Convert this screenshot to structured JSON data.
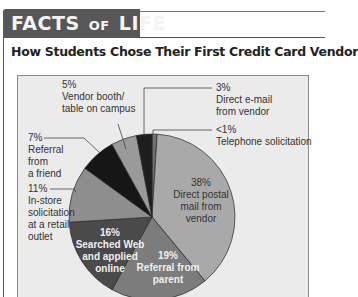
{
  "header": {
    "band_word1": "FACTS",
    "band_word2": "OF",
    "band_word3": "LIFE"
  },
  "title": "How Students Chose Their First Credit Card Vendor",
  "labels": {
    "vendor_booth": {
      "pct": "5%",
      "line1": "Vendor booth/",
      "line2": "table on campus"
    },
    "direct_email": {
      "pct": "3%",
      "line1": "Direct e-mail",
      "line2": "from vendor"
    },
    "telephone": {
      "pct": "<1%",
      "line1": "Telephone solicitation"
    },
    "referral_friend": {
      "pct": "7%",
      "line1": "Referral",
      "line2": "from",
      "line3": "a friend"
    },
    "in_store": {
      "pct": "11%",
      "line1": "In-store",
      "line2": "solicitation",
      "line3": "at a retail",
      "line4": "outlet"
    },
    "direct_postal": {
      "pct": "38%",
      "line1": "Direct postal",
      "line2": "mail from",
      "line3": "vendor"
    },
    "searched_web": {
      "pct": "16%",
      "line1": "Searched Web",
      "line2": "and applied",
      "line3": "online"
    },
    "referral_parent": {
      "pct": "19%",
      "line1": "Referral from",
      "line2": "parent"
    }
  },
  "colors": {
    "header_band": "#575757",
    "plot_background": "#ebebeb",
    "direct_postal": "#a9a9a9",
    "referral_parent": "#7c7c7c",
    "searched_web": "#4a4a4a",
    "in_store": "#8e8e8e",
    "referral_friend": "#161616",
    "vendor_booth": "#9a9a9a",
    "direct_email": "#1e1e1e",
    "telephone": "#6e6e6e"
  },
  "chart_data": {
    "type": "pie",
    "title": "How Students Chose Their First Credit Card Vendor",
    "categories": [
      "Telephone solicitation",
      "Direct postal mail from vendor",
      "Referral from parent",
      "Searched Web and applied online",
      "In-store solicitation at a retail outlet",
      "Referral from a friend",
      "Vendor booth/table on campus",
      "Direct e-mail from vendor"
    ],
    "values": [
      1,
      38,
      19,
      16,
      11,
      7,
      5,
      3
    ],
    "value_labels": [
      "<1%",
      "38%",
      "19%",
      "16%",
      "11%",
      "7%",
      "5%",
      "3%"
    ],
    "unit": "%",
    "start_angle": "12 o'clock",
    "direction": "clockwise",
    "legend": "none (callout labels)"
  }
}
